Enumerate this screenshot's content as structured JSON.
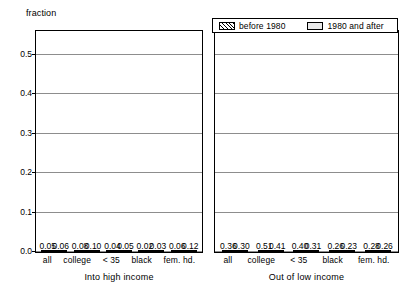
{
  "chart_data": {
    "type": "bar",
    "title": "",
    "xlabel": "",
    "ylabel": "fraction",
    "ylim": [
      0.0,
      0.56
    ],
    "yticks": [
      "0.0",
      "0.1",
      "0.2",
      "0.3",
      "0.4",
      "0.5"
    ],
    "ytick_values": [
      0.0,
      0.1,
      0.2,
      0.3,
      0.4,
      0.5
    ],
    "grid": true,
    "legend_position": "top-right",
    "legend": [
      "before 1980",
      "1980 and after"
    ],
    "categories": [
      "all",
      "college",
      "< 35",
      "black",
      "fem. hd."
    ],
    "panels": [
      {
        "title": "Into high income",
        "categories": [
          "all",
          "college",
          "< 35",
          "black",
          "fem. hd."
        ],
        "series": [
          {
            "name": "before 1980",
            "values": [
              0.05,
              0.08,
              0.04,
              0.02,
              0.06
            ],
            "labels": [
              "0.05",
              "0.08",
              "0.04",
              "0.02",
              "0.06"
            ]
          },
          {
            "name": "1980 and after",
            "values": [
              0.06,
              0.1,
              0.05,
              0.03,
              0.12
            ],
            "labels": [
              "0.06",
              "0.10",
              "0.05",
              "0.03",
              "0.12"
            ]
          }
        ]
      },
      {
        "title": "Out of low income",
        "categories": [
          "all",
          "college",
          "< 35",
          "black",
          "fem. hd."
        ],
        "series": [
          {
            "name": "before 1980",
            "values": [
              0.36,
              0.51,
              0.4,
              0.26,
              0.28
            ],
            "labels": [
              "0.36",
              "0.51",
              "0.40",
              "0.26",
              "0.28"
            ]
          },
          {
            "name": "1980 and after",
            "values": [
              0.3,
              0.41,
              0.31,
              0.23,
              0.26
            ],
            "labels": [
              "0.30",
              "0.41",
              "0.31",
              "0.23",
              "0.26"
            ]
          }
        ]
      }
    ]
  },
  "colors": {
    "axis": "#000000",
    "grid": "#8d8d8d",
    "bar_hatched_fill": "#ffffff",
    "bar_plain_fill": "#e6e6e6",
    "background": "#ffffff"
  }
}
